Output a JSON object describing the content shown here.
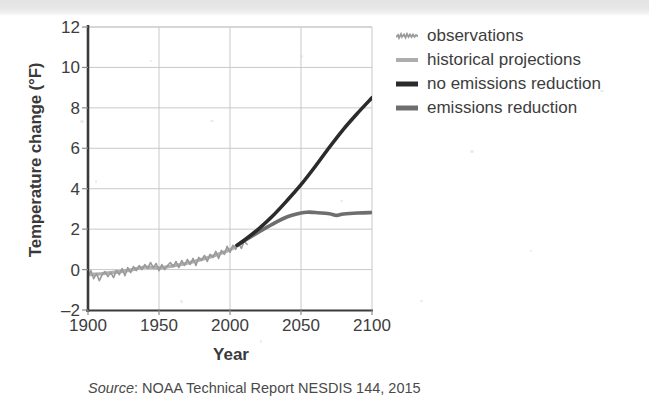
{
  "figure": {
    "source_prefix": "Source",
    "source_separator": ": ",
    "source_text": "NOAA Technical Report NESDIS 144, 2015"
  },
  "axes": {
    "ylabel": "Temperature change (°F)",
    "xlabel": "Year",
    "yticks": [
      "12",
      "10",
      "8",
      "6",
      "4",
      "2",
      "0",
      "–2"
    ],
    "xticks": [
      "1900",
      "1950",
      "2000",
      "2050",
      "2100"
    ]
  },
  "legend": {
    "items": [
      {
        "label": "observations",
        "color": "#9a9a9a",
        "style": "squiggle",
        "width": 2
      },
      {
        "label": "historical projections",
        "color": "#adadad",
        "style": "solid",
        "width": 4
      },
      {
        "label": "no emissions reduction",
        "color": "#2b2b2b",
        "style": "solid",
        "width": 5
      },
      {
        "label": "emissions reduction",
        "color": "#6e6e6e",
        "style": "solid",
        "width": 5
      }
    ]
  },
  "chart_data": {
    "type": "line",
    "title": "",
    "xlabel": "Year",
    "ylabel": "Temperature change (°F)",
    "xlim": [
      1900,
      2100
    ],
    "ylim": [
      -2,
      12
    ],
    "grid": true,
    "legend_position": "right",
    "xticks": [
      1900,
      1950,
      2000,
      2050,
      2100
    ],
    "yticks": [
      -2,
      0,
      2,
      4,
      6,
      8,
      10,
      12
    ],
    "series": [
      {
        "name": "observations",
        "color": "#9a9a9a",
        "width": 1.6,
        "x": [
          1900,
          1902,
          1904,
          1906,
          1908,
          1910,
          1912,
          1914,
          1916,
          1918,
          1920,
          1922,
          1924,
          1926,
          1928,
          1930,
          1932,
          1934,
          1936,
          1938,
          1940,
          1942,
          1944,
          1946,
          1948,
          1950,
          1952,
          1954,
          1956,
          1958,
          1960,
          1962,
          1964,
          1966,
          1968,
          1970,
          1972,
          1974,
          1976,
          1978,
          1980,
          1982,
          1984,
          1986,
          1988,
          1990,
          1992,
          1994,
          1996,
          1998,
          2000,
          2002,
          2004,
          2006,
          2008,
          2010,
          2012
        ],
        "y": [
          -0.3,
          -0.05,
          -0.45,
          -0.2,
          -0.55,
          -0.25,
          -0.1,
          -0.35,
          -0.15,
          -0.4,
          -0.05,
          -0.25,
          0.05,
          -0.3,
          0.1,
          -0.15,
          0.15,
          -0.05,
          0.2,
          0.0,
          0.25,
          0.05,
          0.35,
          0.1,
          0.3,
          -0.05,
          0.25,
          0.0,
          0.2,
          0.35,
          0.15,
          0.4,
          0.1,
          0.45,
          0.2,
          0.5,
          0.25,
          0.55,
          0.2,
          0.6,
          0.45,
          0.7,
          0.4,
          0.75,
          0.6,
          0.9,
          0.55,
          0.95,
          0.75,
          1.15,
          0.85,
          1.2,
          1.0,
          1.3,
          1.05,
          1.4,
          1.25
        ]
      },
      {
        "name": "historical projections",
        "color": "#b0b0b0",
        "width": 3.4,
        "x": [
          1900,
          1910,
          1920,
          1930,
          1940,
          1950,
          1960,
          1970,
          1980,
          1990,
          2000,
          2005
        ],
        "y": [
          -0.25,
          -0.2,
          -0.12,
          -0.02,
          0.12,
          0.08,
          0.18,
          0.32,
          0.5,
          0.72,
          0.98,
          1.2
        ]
      },
      {
        "name": "no emissions reduction",
        "color": "#2b2b2b",
        "width": 3.6,
        "x": [
          2005,
          2010,
          2020,
          2030,
          2040,
          2050,
          2060,
          2070,
          2080,
          2090,
          2100
        ],
        "y": [
          1.2,
          1.45,
          2.0,
          2.65,
          3.4,
          4.2,
          5.1,
          6.05,
          6.95,
          7.75,
          8.5
        ]
      },
      {
        "name": "emissions reduction",
        "color": "#6e6e6e",
        "width": 3.6,
        "x": [
          2005,
          2010,
          2020,
          2030,
          2040,
          2050,
          2055,
          2060,
          2070,
          2075,
          2080,
          2090,
          2100
        ],
        "y": [
          1.2,
          1.42,
          1.85,
          2.25,
          2.6,
          2.8,
          2.84,
          2.82,
          2.76,
          2.68,
          2.75,
          2.8,
          2.82
        ]
      }
    ],
    "annotations": [
      {
        "text": "Source: NOAA Technical Report NESDIS 144, 2015",
        "position": "below-axis"
      }
    ]
  }
}
